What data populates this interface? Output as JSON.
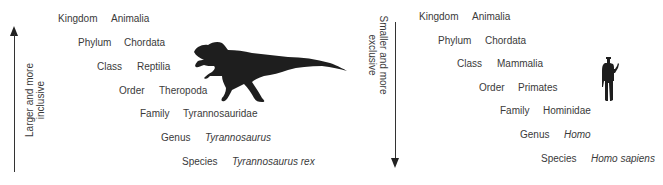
{
  "left_panel": {
    "axis_label_line1": "Larger and more",
    "axis_label_line2": "inclusive",
    "arrow_direction": "up",
    "silhouette": "tyrannosaurus-rex",
    "ranks": [
      {
        "rank": "Kingdom",
        "taxon": "Animalia",
        "italic": false
      },
      {
        "rank": "Phylum",
        "taxon": "Chordata",
        "italic": false
      },
      {
        "rank": "Class",
        "taxon": "Reptilia",
        "italic": false
      },
      {
        "rank": "Order",
        "taxon": "Theropoda",
        "italic": false
      },
      {
        "rank": "Family",
        "taxon": "Tyrannosauridae",
        "italic": false
      },
      {
        "rank": "Genus",
        "taxon": "Tyrannosaurus",
        "italic": true
      },
      {
        "rank": "Species",
        "taxon": "Tyrannosaurus rex",
        "italic": true
      }
    ]
  },
  "right_panel": {
    "axis_label_line1": "Smaller and more",
    "axis_label_line2": "exclusive",
    "arrow_direction": "down",
    "silhouette": "human",
    "ranks": [
      {
        "rank": "Kingdom",
        "taxon": "Animalia",
        "italic": false
      },
      {
        "rank": "Phylum",
        "taxon": "Chordata",
        "italic": false
      },
      {
        "rank": "Class",
        "taxon": "Mammalia",
        "italic": false
      },
      {
        "rank": "Order",
        "taxon": "Primates",
        "italic": false
      },
      {
        "rank": "Family",
        "taxon": "Hominidae",
        "italic": false
      },
      {
        "rank": "Genus",
        "taxon": "Homo",
        "italic": true
      },
      {
        "rank": "Species",
        "taxon": "Homo sapiens",
        "italic": true
      }
    ]
  },
  "colors": {
    "text": "#3a3a3a",
    "silhouette": "#1e1e1e",
    "arrow": "#333333"
  }
}
